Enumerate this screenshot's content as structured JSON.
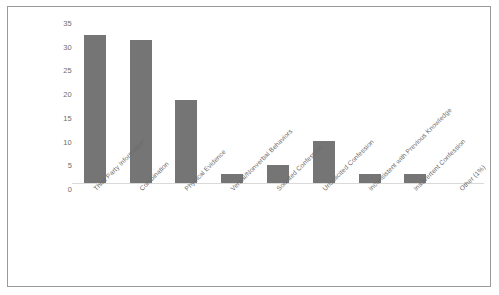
{
  "chart_data": {
    "type": "bar",
    "title": "",
    "xlabel": "",
    "ylabel": "",
    "ylim": [
      0,
      35
    ],
    "yticks": [
      0,
      5,
      10,
      15,
      20,
      25,
      30,
      35
    ],
    "grid": false,
    "legend": null,
    "bar_color": "#757575",
    "categories": [
      "Third Party Information",
      "Combination",
      "Physical Evidence",
      "Verbal/Nonverbal Behaviors",
      "Solicited Confession",
      "Unsolicited Confession",
      "Inconsistent with Previous Knowledge",
      "Inadvertent Confession",
      "Other (1%)"
    ],
    "values": [
      32,
      31,
      18,
      2,
      4,
      9,
      2,
      2,
      0
    ]
  },
  "frame": {
    "border_color": "#9a9a9a",
    "background": "#ffffff"
  },
  "axis": {
    "tick_text_color": "#6e6e6e",
    "label_text_color": "#6b6b6b"
  }
}
